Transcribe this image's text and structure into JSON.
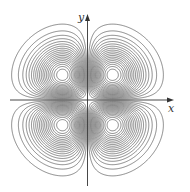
{
  "figure": {
    "axes": {
      "x_label": "x",
      "y_label": "y"
    },
    "function": "x*y*exp(-(x^2+y^2)/2)",
    "origin_px": [
      87.5,
      100
    ],
    "scale_px_per_unit": 25,
    "domain": [
      -3.3,
      3.3
    ],
    "contour_count_per_lobe": 19,
    "stroke_color": "#555555",
    "background_color": "#ffffff"
  }
}
